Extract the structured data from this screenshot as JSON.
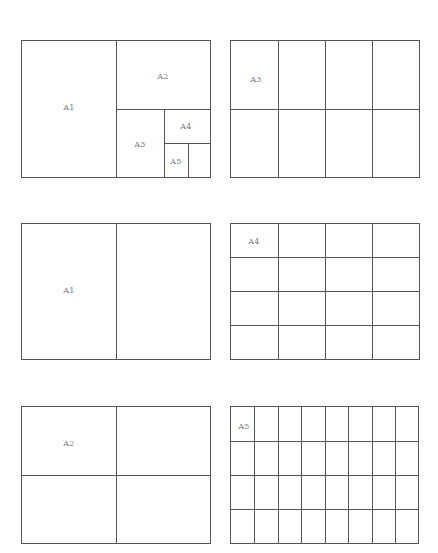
{
  "diagram": {
    "type": "paper-size-subdivision",
    "panels": [
      {
        "id": "overview",
        "labels": [
          "A1",
          "A2",
          "A3",
          "A4",
          "A5"
        ],
        "description": "A0 sheet recursively halved into A1, A2, A3, A4, A5"
      },
      {
        "id": "a3-grid",
        "label": "A3",
        "cols": 4,
        "rows": 2
      },
      {
        "id": "a1-grid",
        "label": "A1",
        "cols": 2,
        "rows": 1
      },
      {
        "id": "a4-grid",
        "label": "A4",
        "cols": 4,
        "rows": 4
      },
      {
        "id": "a2-grid",
        "label": "A2",
        "cols": 2,
        "rows": 2
      },
      {
        "id": "a5-grid",
        "label": "A5",
        "cols": 8,
        "rows": 4
      }
    ]
  },
  "labels": {
    "p1_a1": "A1",
    "p1_a2": "A2",
    "p1_a3": "A3",
    "p1_a4": "A4",
    "p1_a5": "A5",
    "p2": "A3",
    "p3": "A1",
    "p4": "A4",
    "p5": "A2",
    "p6": "A5"
  },
  "colors": {
    "line": "#555555",
    "label": "#777777",
    "background": "#ffffff"
  }
}
